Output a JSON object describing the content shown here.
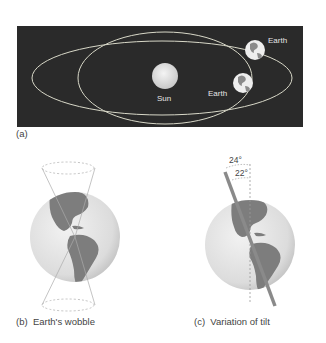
{
  "panel_a": {
    "tag": "(a)",
    "sun_label": "Sun",
    "earth_label_top": "Earth",
    "earth_label_bottom": "Earth",
    "background_color": "#2a2a2a"
  },
  "panel_b": {
    "caption_tag": "(b)",
    "caption": "Earth's wobble"
  },
  "panel_c": {
    "caption_tag": "(c)",
    "caption": "Variation of tilt",
    "angle_max": "24°",
    "angle_min": "22°"
  }
}
